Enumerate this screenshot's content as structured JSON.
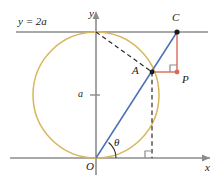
{
  "figure": {
    "background": "#ffffff",
    "width": 224,
    "height": 183
  },
  "colors": {
    "axis": "#8c8c8c",
    "circle": "#d9b65a",
    "ray": "#4a6fb5",
    "segment": "#d96a5a",
    "dashed": "#2b2b2b",
    "point": "#1a1a1a",
    "label": "#1a1a1a"
  },
  "axes": {
    "x_label": "x",
    "y_label": "y",
    "origin_label": "O",
    "x_axis_y": 158,
    "y_axis_x": 96,
    "tick_label": "a",
    "tick_y": 95
  },
  "lines": {
    "horizontal_line_label": "y = 2a",
    "horizontal_line_y": 32
  },
  "points": [
    {
      "name": "C",
      "label": "C",
      "x": 177,
      "y": 32,
      "label_x": 172,
      "label_y": 14,
      "color": "#1a1a1a"
    },
    {
      "name": "A",
      "label": "A",
      "x": 152,
      "y": 72,
      "label_x": 132,
      "label_y": 68,
      "color": "#1a1a1a"
    },
    {
      "name": "P",
      "label": "P",
      "x": 177,
      "y": 72,
      "label_x": 181,
      "label_y": 76,
      "color": "#d96a5a"
    },
    {
      "name": "O",
      "label": "O",
      "x": 96,
      "y": 158,
      "label_x": 86,
      "label_y": 163,
      "color": "#1a1a1a"
    }
  ],
  "angle": {
    "symbol": "θ",
    "label_x": 114,
    "label_y": 141,
    "vertex_x": 96,
    "vertex_y": 158,
    "radius": 20
  },
  "circle": {
    "center_x": 96,
    "center_y": 95,
    "radius": 63,
    "description": "circle of radius a centered at (0, a)"
  },
  "right_angles": [
    {
      "name": "right-angle-at-p",
      "x": 177,
      "y": 72,
      "size": 7,
      "orient": "up-left",
      "color": "#8c8c8c"
    },
    {
      "name": "right-angle-at-foot",
      "x": 152,
      "y": 158,
      "size": 7,
      "orient": "up-left",
      "color": "#8c8c8c"
    }
  ],
  "dashed_lines": [
    {
      "name": "chord-top-to-a",
      "x1": 96,
      "y1": 32,
      "x2": 152,
      "y2": 72
    },
    {
      "name": "vertical-a-to-axis",
      "x1": 152,
      "y1": 72,
      "x2": 152,
      "y2": 158
    }
  ]
}
